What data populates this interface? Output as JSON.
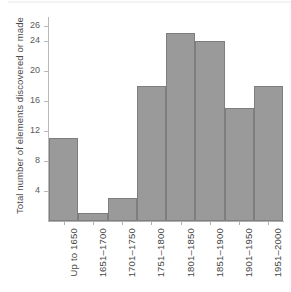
{
  "chart_data": {
    "type": "bar",
    "title": "",
    "xlabel": "",
    "ylabel": "Total number of elements discovered or made",
    "categories": [
      "Up to 1650",
      "1651–1700",
      "1701–1750",
      "1751–1800",
      "1801–1850",
      "1851–1900",
      "1901–1950",
      "1951–2000"
    ],
    "values": [
      11,
      1,
      3,
      18,
      25,
      24,
      15,
      18
    ],
    "yticks": [
      4,
      8,
      12,
      16,
      20,
      24,
      26
    ],
    "ylim": [
      0,
      27
    ],
    "grid": false,
    "legend": false,
    "bar_style": "histogram-adjacent",
    "colors": {
      "bar_fill": "#9a9a9a",
      "bar_edge": "#7e7e7e",
      "axis": "#b0b0b0",
      "text": "#454545",
      "background": "#ffffff"
    }
  }
}
